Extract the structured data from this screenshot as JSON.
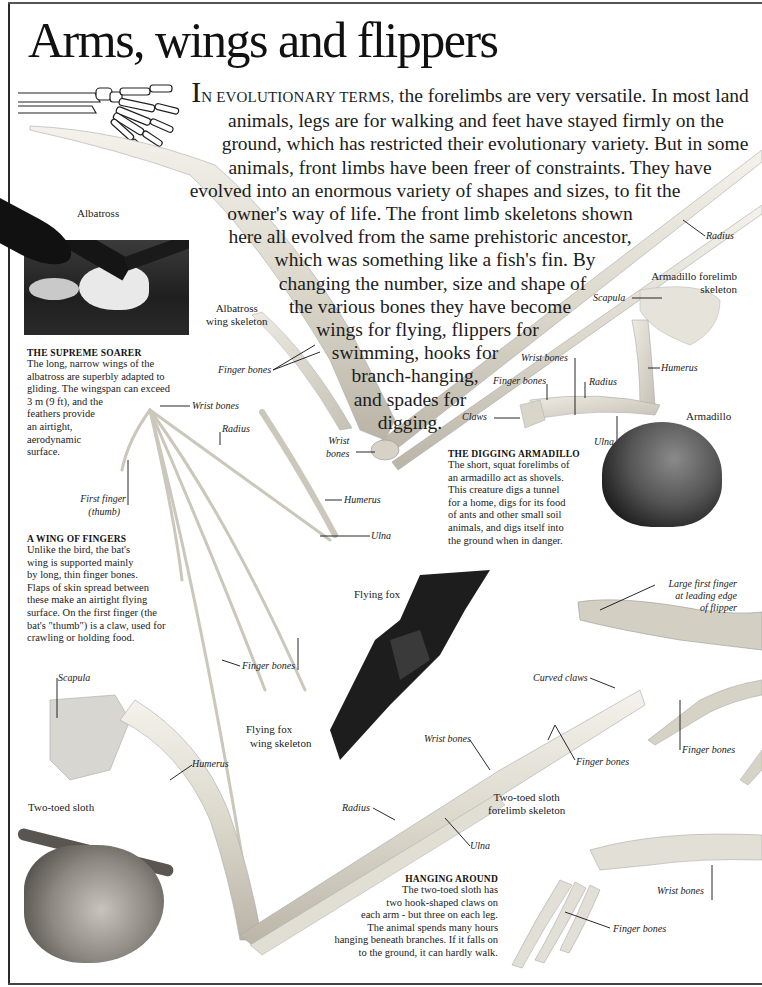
{
  "page": {
    "title": "Arms, wings and flippers",
    "intro": {
      "dropcap": "I",
      "smallcaps": "N EVOLUTIONARY TERMS,",
      "lines": [
        " the forelimbs are very versatile. In most land",
        "animals, legs are for walking and feet have stayed firmly on the",
        "ground, which has restricted their evolutionary variety. But in some",
        "animals, front limbs have been freer of constraints. They have",
        "evolved into an enormous variety of shapes and sizes, to fit the",
        "owner's way of life. The front limb skeletons shown",
        "here all evolved from the same prehistoric ancestor,",
        "which was something like a fish's fin. By",
        "changing the number, size and shape of",
        "the various bones they have become",
        "wings for flying, flippers for",
        "swimming, hooks for",
        "branch-hanging,",
        "and spades for",
        "digging."
      ]
    }
  },
  "albatross": {
    "photo_caption": "Albatross",
    "skeleton_caption": [
      "Albatross",
      "wing skeleton"
    ],
    "labels": {
      "finger_bones": "Finger bones",
      "wrist_bones": [
        "Wrist",
        "bones"
      ],
      "radius": "Radius"
    },
    "box": {
      "title": "THE SUPREME SOARER",
      "lines": [
        "The long, narrow wings of the",
        "albatross are superbly adapted to",
        "gliding. The wingspan can exceed",
        "3 m (9 ft), and the",
        "feathers provide",
        "an airtight,",
        "aerodynamic",
        "surface."
      ]
    }
  },
  "bat": {
    "photo_caption": "Flying fox",
    "skeleton_caption": [
      "Flying fox",
      "wing skeleton"
    ],
    "labels": {
      "wrist_bones": "Wrist bones",
      "radius": "Radius",
      "first_finger": [
        "First finger",
        "(thumb)"
      ],
      "humerus": "Humerus",
      "ulna": "Ulna",
      "finger_bones": "Finger bones"
    },
    "box": {
      "title": "A WING OF FINGERS",
      "lines": [
        "Unlike the bird, the bat's",
        "wing is supported mainly",
        "by long, thin finger bones.",
        "Flaps of skin spread between",
        "these make an airtight flying",
        "surface. On the first finger (the",
        "bat's \"thumb\") is a claw, used for",
        "crawling or holding food."
      ]
    }
  },
  "armadillo": {
    "photo_caption": "Armadillo",
    "skeleton_caption": [
      "Armadillo forelimb",
      "skeleton"
    ],
    "labels": {
      "scapula": "Scapula",
      "wrist_bones": "Wrist bones",
      "finger_bones": "Finger bones",
      "radius": "Radius",
      "humerus": "Humerus",
      "claws": "Claws",
      "ulna": "Ulna"
    },
    "box": {
      "title": "THE DIGGING ARMADILLO",
      "lines": [
        "The short, squat forelimbs of",
        "an armadillo act as shovels.",
        "This creature digs a tunnel",
        "for a home, digs for its food",
        "of ants and other small soil",
        "animals, and digs itself into",
        "the ground when in danger."
      ]
    }
  },
  "flipper": {
    "labels": {
      "large_first_finger": [
        "Large first finger",
        "at leading edge",
        "of flipper"
      ],
      "finger_bones": "Finger bones"
    }
  },
  "sloth": {
    "photo_caption": "Two-toed sloth",
    "skeleton_caption": [
      "Two-toed sloth",
      "forelimb skeleton"
    ],
    "labels": {
      "scapula": "Scapula",
      "humerus": "Humerus",
      "radius": "Radius",
      "ulna": "Ulna",
      "wrist_bones": "Wrist bones",
      "finger_bones": "Finger bones",
      "curved_claws": "Curved claws"
    },
    "box": {
      "title": "HANGING AROUND",
      "lines": [
        "The two-toed sloth has",
        "two hook-shaped claws on",
        "each arm - but three on each leg.",
        "The animal spends many hours",
        "hanging beneath branches. If it falls on",
        "to the ground, it can hardly walk."
      ]
    }
  },
  "human_hand": {
    "labels": {
      "wrist_bones": "Wrist bones",
      "finger_bones": "Finger bones"
    }
  },
  "radius_top_right": "Radius"
}
